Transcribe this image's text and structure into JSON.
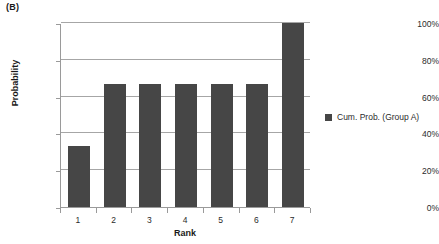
{
  "panel": {
    "label": "(B)"
  },
  "chart_data": {
    "type": "bar",
    "title": "",
    "categories": [
      "1",
      "2",
      "3",
      "4",
      "5",
      "6",
      "7"
    ],
    "values": [
      33.3,
      66.7,
      66.7,
      66.7,
      66.7,
      66.7,
      100
    ],
    "value_unit": "%",
    "series": [
      {
        "name": "Cum. Prob. (Group A)",
        "values": [
          33.3,
          66.7,
          66.7,
          66.7,
          66.7,
          66.7,
          100
        ],
        "color": "#464646"
      }
    ],
    "xlabel": "Rank",
    "ylabel": "Probability",
    "ylim": [
      0,
      100
    ],
    "yticks": [
      0,
      20,
      40,
      60,
      80,
      100
    ],
    "ytick_labels": [
      "0%",
      "20%",
      "40%",
      "60%",
      "80%",
      "100%"
    ],
    "grid": "horizontal",
    "legend_position": "right",
    "legend": [
      "Cum. Prob. (Group A)"
    ]
  },
  "colors": {
    "bar": "#464646",
    "gridline": "#a6a6a6",
    "axis": "#9a9a9a",
    "text": "#2b2b2b",
    "background": "#ffffff"
  }
}
